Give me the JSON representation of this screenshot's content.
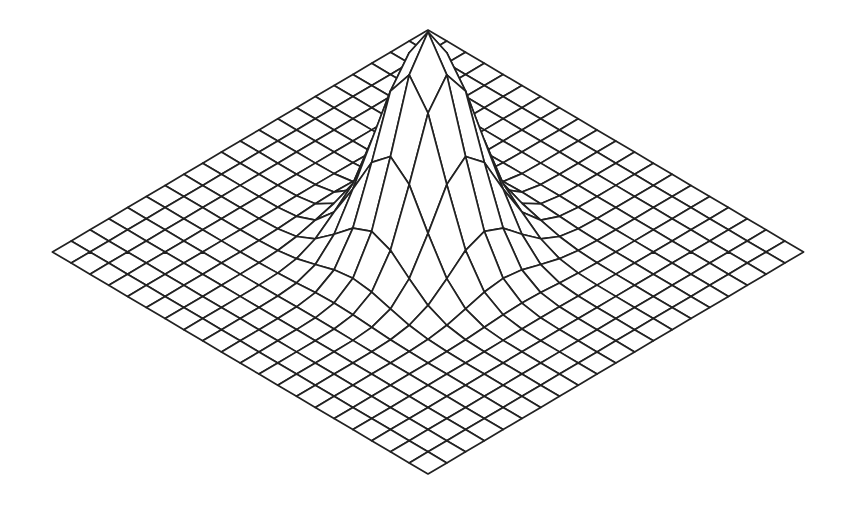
{
  "chart_data": {
    "type": "surface-wireframe",
    "title": "",
    "xlabel": "",
    "ylabel": "",
    "zlabel": "",
    "axes_visible": false,
    "grid": {
      "cells_x": 20,
      "cells_y": 20
    },
    "function": {
      "kind": "gaussian",
      "formula": "z = exp(-((x-10)^2 + (y-10)^2) / 6.4)",
      "center": [
        10,
        10
      ],
      "width_param": 6.4,
      "peak_value": 1.0
    },
    "sample_profile_along_diagonal": [
      {
        "r_squared": 0,
        "z": 1.0
      },
      {
        "r_squared": 2,
        "z": 0.745
      },
      {
        "r_squared": 8,
        "z": 0.255
      },
      {
        "r_squared": 18,
        "z": 0.064
      }
    ],
    "projection": {
      "center_px": [
        428,
        252
      ],
      "step_x_px": 18.78,
      "step_y_px": 11.1,
      "z_scale_px": 220
    },
    "colors": {
      "line": "#222222",
      "fill": "#ffffff",
      "background": "#ffffff"
    }
  }
}
